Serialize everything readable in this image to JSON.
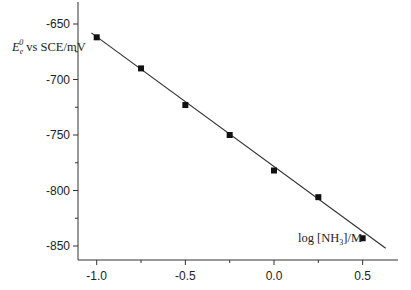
{
  "chart_data": {
    "type": "scatter",
    "title": "",
    "xlabel": "log [NH3]/M",
    "ylabel": "E_e^0 vs SCE/mV",
    "xlim": [
      -1.1,
      0.65
    ],
    "ylim": [
      -860,
      -640
    ],
    "x_ticks": [
      -1.0,
      -0.5,
      0.0,
      0.5
    ],
    "x_tick_labels": [
      "-1.0",
      "-0.5",
      "0.0",
      "0.5"
    ],
    "y_ticks": [
      -650,
      -700,
      -750,
      -800,
      -850
    ],
    "y_tick_labels": [
      "-650",
      "-700",
      "-750",
      "-800",
      "-850"
    ],
    "grid": false,
    "legend": null,
    "series": [
      {
        "name": "data",
        "marker": "square",
        "x": [
          -1.0,
          -0.75,
          -0.5,
          -0.25,
          0.0,
          0.25,
          0.5
        ],
        "y": [
          -662,
          -690,
          -723,
          -750,
          -782,
          -806,
          -843
        ]
      },
      {
        "name": "linear fit",
        "type": "line",
        "x": [
          -1.03,
          0.63
        ],
        "y": [
          -658,
          -852
        ]
      }
    ]
  },
  "labels": {
    "ylabel_main": "E",
    "ylabel_sub": "e",
    "ylabel_sup": "0",
    "ylabel_rest": " vs SCE/mV",
    "xlabel_pre": "log [NH",
    "xlabel_sub": "3",
    "xlabel_post": "]/M"
  }
}
